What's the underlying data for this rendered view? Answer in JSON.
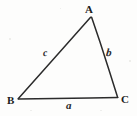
{
  "figure": {
    "kind": "geometry-diagram",
    "shape": "triangle",
    "background_color": "#fdfdfc",
    "stroke_color": "#2b2b2b",
    "label_color": "#1c1c1c"
  },
  "vertices": [
    {
      "id": "A",
      "label": "A",
      "x": 91,
      "y": 16
    },
    {
      "id": "B",
      "label": "B",
      "x": 17,
      "y": 99
    },
    {
      "id": "C",
      "label": "C",
      "x": 118,
      "y": 98
    }
  ],
  "sides": [
    {
      "id": "a",
      "label": "a",
      "between": "B-C",
      "x1": 17,
      "y1": 99,
      "x2": 118,
      "y2": 98
    },
    {
      "id": "b",
      "label": "b",
      "between": "A-C",
      "x1": 91,
      "y1": 16,
      "x2": 118,
      "y2": 98
    },
    {
      "id": "c",
      "label": "c",
      "between": "A-B",
      "x1": 91,
      "y1": 16,
      "x2": 17,
      "y2": 99
    }
  ],
  "paths": {
    "triangle": "M 91 16 L 17.5 99 L 118 97.5 Z"
  }
}
